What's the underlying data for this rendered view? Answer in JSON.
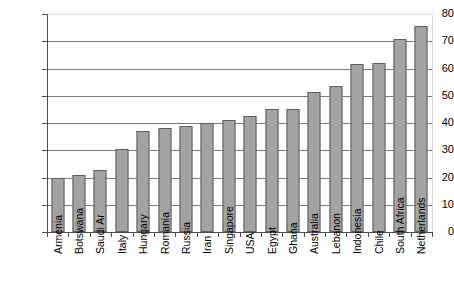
{
  "chart_data": {
    "type": "bar",
    "title": "",
    "subtitle": "",
    "xlabel": "",
    "ylabel": "",
    "ylim": [
      0,
      80
    ],
    "ytick_step": 10,
    "yticks": [
      80,
      70,
      60,
      50,
      40,
      30,
      20,
      10,
      0
    ],
    "grid": true,
    "legend": false,
    "legend_position": "none",
    "orientation": "vertical",
    "categories": [
      "Armenia",
      "Botswana",
      "Saudi Ar",
      "Italy",
      "Hungary",
      "Romania",
      "Russia",
      "Iran",
      "Singapore",
      "USA",
      "Egypt",
      "Ghana",
      "Australia",
      "Lebanon",
      "Indonesia",
      "Chile",
      "South Africa",
      "Netherlands"
    ],
    "values": [
      20.0,
      21.1,
      22.7,
      30.6,
      37.0,
      38.0,
      39.0,
      40.0,
      41.0,
      42.5,
      45.3,
      45.3,
      51.5,
      53.5,
      61.5,
      62.0,
      71.0,
      75.5
    ],
    "annotations": []
  },
  "style": {
    "bar_fill": "#a3a3a3",
    "bar_border": "#5e5e5e",
    "axis_color": "#4d4d4d",
    "gridline_color": "#7a7a7a",
    "plot_frame_color": "#d9d9d9",
    "background": "#ffffff",
    "text_color": "#000000"
  }
}
